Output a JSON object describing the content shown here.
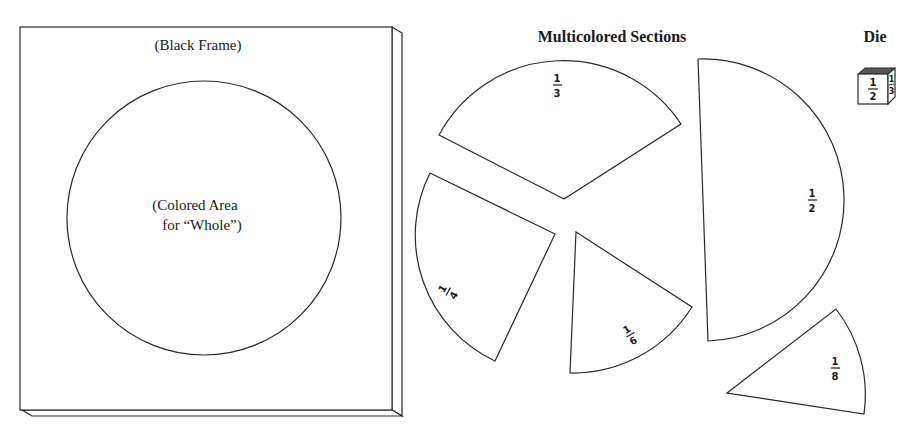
{
  "frame": {
    "label": "(Black Frame)",
    "circle_label_line1": "(Colored Area",
    "circle_label_line2": "for “Whole”)"
  },
  "sections": {
    "title": "Multicolored Sections",
    "pieces": [
      {
        "id": "third",
        "num": "1",
        "den": "3"
      },
      {
        "id": "quarter",
        "num": "1",
        "den": "4"
      },
      {
        "id": "sixth",
        "num": "1",
        "den": "6"
      },
      {
        "id": "half",
        "num": "1",
        "den": "2"
      },
      {
        "id": "eighth",
        "num": "1",
        "den": "8"
      }
    ]
  },
  "die": {
    "title": "Die",
    "front_num": "1",
    "front_den": "2",
    "side_num": "1",
    "side_den": "3"
  }
}
